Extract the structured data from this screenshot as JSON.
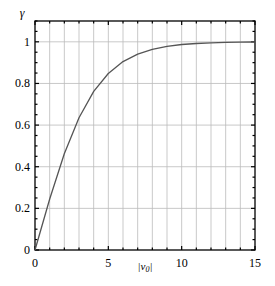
{
  "chart_data": {
    "type": "line",
    "title": "",
    "xlabel": "|v0|",
    "ylabel": "γ",
    "xlim": [
      0,
      15
    ],
    "ylim": [
      0,
      1.1
    ],
    "grid": true,
    "x_ticks": [
      0,
      5,
      10,
      15
    ],
    "y_ticks": [
      0,
      0.2,
      0.4,
      0.6,
      0.8,
      1
    ],
    "y_tick_labels": [
      "0",
      "0.2",
      "0.4",
      "0.6",
      "0.8",
      "1"
    ],
    "x_tick_labels": [
      "0",
      "5",
      "10",
      "15"
    ],
    "series": [
      {
        "name": "γ",
        "x": [
          0,
          1,
          2,
          3,
          4,
          5,
          6,
          7,
          8,
          9,
          10,
          11,
          12,
          13,
          14,
          15
        ],
        "values": [
          0,
          0.245,
          0.462,
          0.635,
          0.762,
          0.848,
          0.905,
          0.941,
          0.964,
          0.978,
          0.987,
          0.992,
          0.995,
          0.997,
          0.998,
          0.999
        ]
      }
    ],
    "colors": {
      "line": "#555555",
      "grid": "#bbbbbb",
      "axis": "#000000"
    }
  }
}
